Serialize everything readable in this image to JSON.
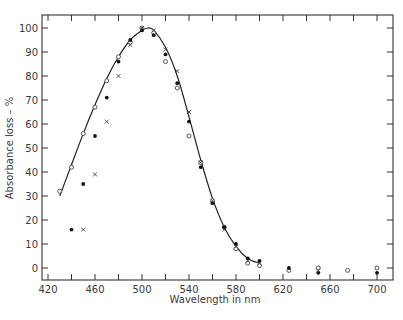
{
  "chart_data": {
    "type": "scatter",
    "title": "",
    "xlabel": "Wavelength in nm",
    "ylabel": "Absorbance loss – %",
    "xlim": [
      412,
      712
    ],
    "ylim": [
      -5,
      105
    ],
    "x_ticks": [
      420,
      460,
      500,
      540,
      580,
      620,
      660,
      700
    ],
    "x_minor_ticks": [
      440,
      480,
      520,
      560,
      600,
      640,
      680
    ],
    "y_ticks": [
      0,
      10,
      20,
      30,
      40,
      50,
      60,
      70,
      80,
      90,
      100
    ],
    "grid": false,
    "legend": null,
    "series": [
      {
        "name": "open-circles",
        "marker": "open-circle",
        "points": [
          [
            430,
            32
          ],
          [
            440,
            42
          ],
          [
            450,
            56
          ],
          [
            460,
            67
          ],
          [
            470,
            78
          ],
          [
            480,
            88
          ],
          [
            490,
            94
          ],
          [
            500,
            100
          ],
          [
            510,
            98
          ],
          [
            520,
            86
          ],
          [
            530,
            75
          ],
          [
            540,
            55
          ],
          [
            550,
            44
          ],
          [
            560,
            28
          ],
          [
            570,
            17
          ],
          [
            580,
            8
          ],
          [
            590,
            2
          ],
          [
            600,
            1
          ],
          [
            625,
            -1
          ],
          [
            650,
            0
          ],
          [
            675,
            -1
          ],
          [
            700,
            0
          ]
        ]
      },
      {
        "name": "filled-dots",
        "marker": "filled-circle",
        "points": [
          [
            440,
            16
          ],
          [
            450,
            35
          ],
          [
            460,
            55
          ],
          [
            470,
            71
          ],
          [
            480,
            86
          ],
          [
            490,
            95
          ],
          [
            500,
            99
          ],
          [
            510,
            97
          ],
          [
            520,
            89
          ],
          [
            530,
            77
          ],
          [
            540,
            61
          ],
          [
            550,
            42
          ],
          [
            560,
            27
          ],
          [
            570,
            17
          ],
          [
            580,
            10
          ],
          [
            590,
            4
          ],
          [
            600,
            3
          ],
          [
            625,
            0
          ],
          [
            650,
            -2
          ],
          [
            700,
            -2
          ]
        ]
      },
      {
        "name": "crosses",
        "marker": "x",
        "points": [
          [
            450,
            16
          ],
          [
            460,
            39
          ],
          [
            470,
            61
          ],
          [
            480,
            80
          ],
          [
            490,
            93
          ],
          [
            500,
            100
          ],
          [
            510,
            99
          ],
          [
            520,
            91
          ],
          [
            530,
            82
          ],
          [
            540,
            65
          ],
          [
            550,
            44
          ],
          [
            560,
            28
          ],
          [
            570,
            16
          ],
          [
            580,
            9
          ],
          [
            590,
            3
          ],
          [
            600,
            2
          ],
          [
            650,
            -1
          ]
        ]
      }
    ],
    "fitted_curve": [
      [
        430,
        30
      ],
      [
        440,
        43
      ],
      [
        450,
        56
      ],
      [
        460,
        68
      ],
      [
        470,
        79
      ],
      [
        480,
        88
      ],
      [
        490,
        95
      ],
      [
        500,
        99
      ],
      [
        505,
        100
      ],
      [
        510,
        99
      ],
      [
        520,
        92
      ],
      [
        530,
        80
      ],
      [
        540,
        63
      ],
      [
        550,
        45
      ],
      [
        560,
        29
      ],
      [
        570,
        17
      ],
      [
        580,
        9
      ],
      [
        590,
        4
      ],
      [
        600,
        2
      ]
    ]
  }
}
